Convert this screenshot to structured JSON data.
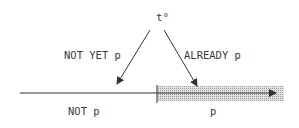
{
  "diagram": {
    "top_label": "t°",
    "left_arrow_label": "NOT YET p",
    "right_arrow_label": "ALREADY p",
    "left_segment_label": "NOT p",
    "right_segment_label": "p",
    "colors": {
      "line": "#333333",
      "shade": "#c8c8c8",
      "text": "#3a3a3a"
    }
  }
}
